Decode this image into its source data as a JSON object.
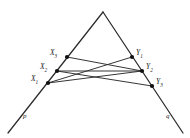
{
  "figure": {
    "background_color": "#ffffff",
    "line_color": "#2b2b2b",
    "point_color": "#111111",
    "apex": {
      "x": 103,
      "y": 12
    },
    "rays": [
      {
        "name": "p",
        "label": "p",
        "label_x": 23,
        "label_y": 113,
        "from": {
          "x": 103,
          "y": 12
        },
        "to": {
          "x": 8,
          "y": 133
        }
      },
      {
        "name": "q",
        "label": "q",
        "label_x": 166,
        "label_y": 113,
        "from": {
          "x": 103,
          "y": 12
        },
        "to": {
          "x": 183,
          "y": 133
        }
      }
    ],
    "points_left": [
      {
        "id": "X3",
        "label": "X",
        "sub": "3",
        "x": 67,
        "y": 57,
        "label_x": 50,
        "label_y": 49
      },
      {
        "id": "X2",
        "label": "X",
        "sub": "2",
        "x": 57,
        "y": 71,
        "label_x": 40,
        "label_y": 63
      },
      {
        "id": "X1",
        "label": "X",
        "sub": "1",
        "x": 48,
        "y": 83,
        "label_x": 31,
        "label_y": 75
      }
    ],
    "points_right": [
      {
        "id": "Y1",
        "label": "Y",
        "sub": "1",
        "x": 132,
        "y": 57,
        "label_x": 136,
        "label_y": 49
      },
      {
        "id": "Y2",
        "label": "Y",
        "sub": "2",
        "x": 142,
        "y": 71,
        "label_x": 146,
        "label_y": 63
      },
      {
        "id": "Y3",
        "label": "Y",
        "sub": "3",
        "x": 152,
        "y": 86,
        "label_x": 156,
        "label_y": 78
      }
    ],
    "connections": [
      {
        "from": "X3",
        "to": "Y2"
      },
      {
        "from": "X2",
        "to": "Y2"
      },
      {
        "from": "X2",
        "to": "Y3"
      },
      {
        "from": "X1",
        "to": "Y1"
      },
      {
        "from": "X1",
        "to": "Y2"
      }
    ]
  }
}
